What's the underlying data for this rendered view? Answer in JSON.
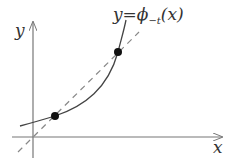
{
  "diagram": {
    "axes": {
      "x_label": "x",
      "y_label": "y"
    },
    "curve_label": "y = ϕ−t(x)",
    "curve_label_parts": {
      "lhs": "y",
      "eq": "=",
      "phi": "ϕ",
      "sub": "−t",
      "arg": "(x)"
    },
    "series": [
      {
        "name": "curve y = ϕ_{-t}(x)",
        "style": "solid"
      },
      {
        "name": "diagonal y = x",
        "style": "dashed"
      }
    ],
    "points": [
      {
        "name": "lower-fixed-point"
      },
      {
        "name": "upper-fixed-point"
      }
    ],
    "colors": {
      "line": "#444444",
      "dashed": "#888888",
      "point": "#111111"
    }
  }
}
